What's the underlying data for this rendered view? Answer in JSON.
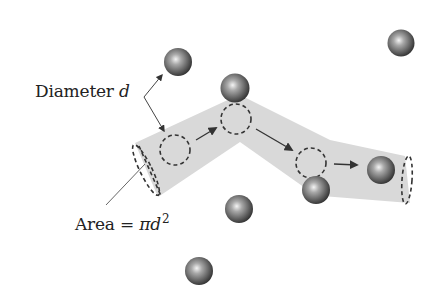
{
  "diagram": {
    "type": "collision-cylinder-illustration",
    "labels": {
      "diameter": {
        "text": "Diameter",
        "variable": "d"
      },
      "area": {
        "text": "Area = ",
        "formula_symbol": "π",
        "variable": "d",
        "exponent": "2"
      }
    },
    "colors": {
      "tube_fill": "#d9d9d9",
      "dash_stroke": "#333333",
      "arrow_stroke": "#333333",
      "sphere_dark": "#3a3a3a",
      "sphere_mid": "#8a8a8a",
      "sphere_highlight": "#f2f2f2",
      "text": "#222222"
    },
    "spheres": [
      {
        "id": "sphere-1",
        "cx": 178,
        "cy": 62,
        "r": 14
      },
      {
        "id": "sphere-2",
        "cx": 401,
        "cy": 43,
        "r": 13.5
      },
      {
        "id": "sphere-3",
        "cx": 235,
        "cy": 88,
        "r": 14.5
      },
      {
        "id": "sphere-4",
        "cx": 316,
        "cy": 190,
        "r": 14
      },
      {
        "id": "sphere-5",
        "cx": 381,
        "cy": 170,
        "r": 14
      },
      {
        "id": "sphere-6",
        "cx": 239,
        "cy": 209,
        "r": 14
      },
      {
        "id": "sphere-7",
        "cx": 199,
        "cy": 271,
        "r": 14
      }
    ],
    "path_circles": [
      {
        "id": "path-circle-1",
        "cx": 175,
        "cy": 150,
        "r": 15
      },
      {
        "id": "path-circle-2",
        "cx": 236,
        "cy": 119,
        "r": 15
      },
      {
        "id": "path-circle-3",
        "cx": 311,
        "cy": 163,
        "r": 15
      }
    ],
    "motion_arrows": [
      {
        "id": "motion-arrow-1",
        "x1": 197,
        "y1": 139,
        "x2": 216,
        "y2": 128
      },
      {
        "id": "motion-arrow-2",
        "x1": 256,
        "y1": 129,
        "x2": 291,
        "y2": 150
      },
      {
        "id": "motion-arrow-3",
        "x1": 334,
        "y1": 164,
        "x2": 356,
        "y2": 165
      }
    ]
  }
}
